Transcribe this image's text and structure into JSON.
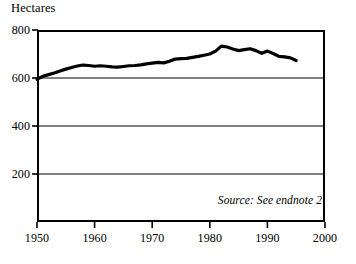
{
  "chart_data": {
    "type": "line",
    "title": "",
    "ylabel": "Hectares",
    "xlabel": "",
    "ylim": [
      0,
      800
    ],
    "xlim": [
      1950,
      2000
    ],
    "yticks": [
      200,
      400,
      600,
      800
    ],
    "ytick_labels": [
      "200",
      "400",
      "600",
      "800"
    ],
    "xticks": [
      1950,
      1960,
      1970,
      1980,
      1990,
      2000
    ],
    "xtick_labels": [
      "1950",
      "1960",
      "1970",
      "1980",
      "1990",
      "2000"
    ],
    "grid": "horizontal",
    "legend": "none",
    "line_color": "#000000",
    "line_width": 3.2,
    "annotations": [
      {
        "text": "Source: See endnote 2",
        "position": "bottom-right-inside",
        "style": "italic"
      }
    ],
    "x": [
      1950,
      1951,
      1952,
      1953,
      1954,
      1955,
      1956,
      1957,
      1958,
      1959,
      1960,
      1961,
      1962,
      1963,
      1964,
      1965,
      1966,
      1967,
      1968,
      1969,
      1970,
      1971,
      1972,
      1973,
      1974,
      1975,
      1976,
      1977,
      1978,
      1979,
      1980,
      1981,
      1982,
      1983,
      1984,
      1985,
      1986,
      1987,
      1988,
      1989,
      1990,
      1991,
      1992,
      1993,
      1994,
      1995
    ],
    "values": [
      595,
      607,
      614,
      621,
      629,
      637,
      644,
      650,
      654,
      652,
      649,
      651,
      649,
      646,
      645,
      648,
      651,
      652,
      655,
      659,
      662,
      665,
      663,
      670,
      679,
      681,
      682,
      686,
      690,
      695,
      700,
      712,
      733,
      729,
      721,
      714,
      718,
      722,
      714,
      703,
      712,
      702,
      690,
      688,
      684,
      673
    ],
    "series_name": "Grain harvested area per capita",
    "units": "Hectares"
  },
  "figure": {
    "source_note": "Source: See endnote 2",
    "background_color": "#ffffff",
    "axis_color": "#000000",
    "grid_color": "#000000"
  }
}
